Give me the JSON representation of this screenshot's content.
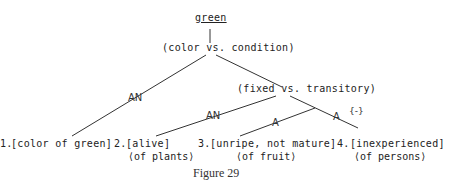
{
  "diagram": {
    "root": "green",
    "node_color_condition": "(color vs. condition)",
    "node_fixed_transitory": "(fixed vs. transitory)",
    "markers": {
      "m1": "AN",
      "m2": "AN",
      "m3": "A",
      "m4": "A",
      "m4_extra": "{-}"
    },
    "leaves": [
      {
        "num": "1.",
        "sense": "[color of green]",
        "sub": ""
      },
      {
        "num": "2.",
        "sense": "[alive]",
        "sub": "⟨of plants⟩"
      },
      {
        "num": "3.",
        "sense": "[unripe, not mature]",
        "sub": "⟨of fruit⟩"
      },
      {
        "num": "4.",
        "sense": "[inexperienced]",
        "sub": "⟨of persons⟩"
      }
    ],
    "caption": "Figure 29"
  }
}
